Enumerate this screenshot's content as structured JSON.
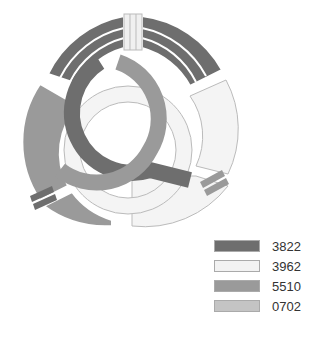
{
  "emblem": {
    "colors": {
      "dark": "#6e6e6e",
      "white": "#f2f2f2",
      "mid": "#9a9a9a",
      "light": "#c4c4c4",
      "outline": "#b8b8b8"
    }
  },
  "legend": {
    "items": [
      {
        "label": "3822",
        "color": "#6e6e6e"
      },
      {
        "label": "3962",
        "color": "#f2f2f2"
      },
      {
        "label": "5510",
        "color": "#9a9a9a"
      },
      {
        "label": "0702",
        "color": "#c4c4c4"
      }
    ]
  }
}
